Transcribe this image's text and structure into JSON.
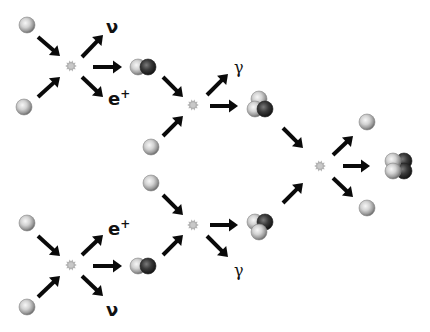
{
  "diagram": {
    "colors": {
      "background": "#ffffff",
      "arrow": "#0a0a0a",
      "proton_light": "#f2f2f2",
      "proton_mid": "#b8b8b8",
      "proton_edge": "#6e6e6e",
      "neutron_light": "#6a6a6a",
      "neutron_dark": "#1a1a1a",
      "starburst": "#a8a8a8"
    },
    "labels": {
      "neutrino": "ν",
      "positron_base": "e",
      "positron_sup": "+",
      "gamma": "γ"
    },
    "particles": {
      "protons": [
        {
          "id": "p1",
          "x": 27,
          "y": 25
        },
        {
          "id": "p2",
          "x": 24,
          "y": 107
        },
        {
          "id": "p3",
          "x": 151,
          "y": 147
        },
        {
          "id": "p4",
          "x": 151,
          "y": 183
        },
        {
          "id": "p5",
          "x": 27,
          "y": 223
        },
        {
          "id": "p6",
          "x": 27,
          "y": 307
        },
        {
          "id": "p7",
          "x": 367,
          "y": 122
        },
        {
          "id": "p8",
          "x": 367,
          "y": 208
        }
      ],
      "deuterium": [
        {
          "id": "d1",
          "x": 143,
          "y": 67
        },
        {
          "id": "d2",
          "x": 143,
          "y": 266
        }
      ],
      "helium3": [
        {
          "id": "he3a",
          "x": 260,
          "y": 105,
          "orientation": "top"
        },
        {
          "id": "he3b",
          "x": 260,
          "y": 226,
          "orientation": "bottom"
        }
      ],
      "helium4": [
        {
          "id": "he4",
          "x": 398,
          "y": 166
        }
      ]
    },
    "reactions": [
      {
        "id": "r1",
        "x": 71,
        "y": 66
      },
      {
        "id": "r2",
        "x": 193,
        "y": 105
      },
      {
        "id": "r3",
        "x": 320,
        "y": 166
      },
      {
        "id": "r4",
        "x": 193,
        "y": 225
      },
      {
        "id": "r5",
        "x": 71,
        "y": 265
      }
    ],
    "arrows": [
      {
        "x1": 38,
        "y1": 37,
        "x2": 60,
        "y2": 56
      },
      {
        "x1": 38,
        "y1": 97,
        "x2": 60,
        "y2": 77
      },
      {
        "x1": 82,
        "y1": 57,
        "x2": 103,
        "y2": 35
      },
      {
        "x1": 93,
        "y1": 67,
        "x2": 122,
        "y2": 67
      },
      {
        "x1": 82,
        "y1": 77,
        "x2": 103,
        "y2": 97
      },
      {
        "x1": 163,
        "y1": 77,
        "x2": 183,
        "y2": 97
      },
      {
        "x1": 163,
        "y1": 136,
        "x2": 183,
        "y2": 116
      },
      {
        "x1": 207,
        "y1": 95,
        "x2": 228,
        "y2": 74
      },
      {
        "x1": 210,
        "y1": 106,
        "x2": 238,
        "y2": 106
      },
      {
        "x1": 283,
        "y1": 128,
        "x2": 303,
        "y2": 148
      },
      {
        "x1": 283,
        "y1": 203,
        "x2": 303,
        "y2": 183
      },
      {
        "x1": 333,
        "y1": 155,
        "x2": 353,
        "y2": 136
      },
      {
        "x1": 343,
        "y1": 166,
        "x2": 370,
        "y2": 166
      },
      {
        "x1": 333,
        "y1": 178,
        "x2": 353,
        "y2": 197
      },
      {
        "x1": 163,
        "y1": 195,
        "x2": 183,
        "y2": 215
      },
      {
        "x1": 163,
        "y1": 255,
        "x2": 183,
        "y2": 235
      },
      {
        "x1": 210,
        "y1": 225,
        "x2": 238,
        "y2": 225
      },
      {
        "x1": 207,
        "y1": 236,
        "x2": 228,
        "y2": 257
      },
      {
        "x1": 38,
        "y1": 236,
        "x2": 60,
        "y2": 256
      },
      {
        "x1": 38,
        "y1": 297,
        "x2": 60,
        "y2": 276
      },
      {
        "x1": 82,
        "y1": 255,
        "x2": 103,
        "y2": 235
      },
      {
        "x1": 93,
        "y1": 266,
        "x2": 122,
        "y2": 266
      },
      {
        "x1": 82,
        "y1": 276,
        "x2": 103,
        "y2": 296
      }
    ],
    "text_labels": [
      {
        "id": "nu-top",
        "kind": "neutrino",
        "x": 106,
        "y": 33
      },
      {
        "id": "eplus-top",
        "kind": "positron",
        "x": 108,
        "y": 105
      },
      {
        "id": "gamma-top",
        "kind": "gamma",
        "x": 234,
        "y": 73
      },
      {
        "id": "gamma-bottom",
        "kind": "gamma",
        "x": 234,
        "y": 276
      },
      {
        "id": "eplus-bottom",
        "kind": "positron",
        "x": 108,
        "y": 235
      },
      {
        "id": "nu-bottom",
        "kind": "neutrino",
        "x": 106,
        "y": 316
      }
    ]
  }
}
